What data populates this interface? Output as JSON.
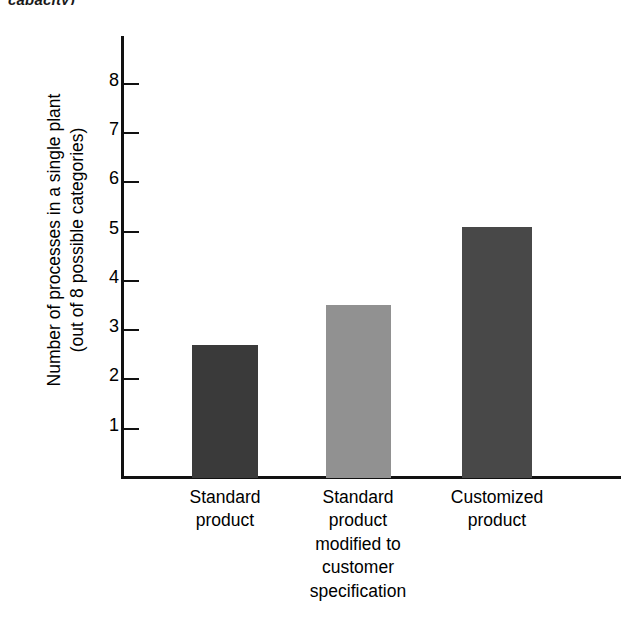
{
  "caption_fragment": "capacity)",
  "chart_data": {
    "type": "bar",
    "title": "",
    "subtitle": "",
    "xlabel": "",
    "ylabel": "Number of processes in a single plant (out of 8 possible categories)",
    "ylabel_line1": "Number of processes in a single plant",
    "ylabel_line2": "(out of 8 possible categories)",
    "categories": [
      "Standard product",
      "Standard product modified to customer specification",
      "Customized product"
    ],
    "category_lines": [
      [
        "Standard",
        "product"
      ],
      [
        "Standard",
        "product",
        "modified to",
        "customer",
        "specification"
      ],
      [
        "Customized",
        "product"
      ]
    ],
    "values": [
      2.7,
      3.5,
      5.1
    ],
    "ylim": [
      0,
      8.6
    ],
    "yticks": [
      1,
      2,
      3,
      4,
      5,
      6,
      7,
      8
    ],
    "ytick_labels": [
      "1",
      "2",
      "3",
      "4",
      "5",
      "6",
      "7",
      "8"
    ],
    "grid": false,
    "legend": "none",
    "bar_colors": [
      "#3a3a3a",
      "#919191",
      "#484848"
    ],
    "axis_color": "#111111"
  }
}
